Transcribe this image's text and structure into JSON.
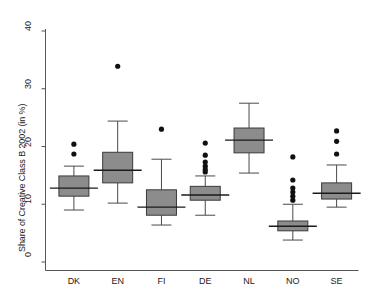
{
  "chart_data": {
    "type": "box",
    "title": "",
    "xlabel": "",
    "ylabel": "Share of Creative Class B 2002 (in %)",
    "ylim": [
      0,
      40
    ],
    "yticks": [
      0,
      10,
      20,
      30,
      40
    ],
    "ytick_labels": [
      "0",
      "10",
      "20",
      "30",
      "40"
    ],
    "grid": false,
    "legend": "none",
    "categories": [
      "DK",
      "EN",
      "FI",
      "DE",
      "NL",
      "NO",
      "SE"
    ],
    "boxes": [
      {
        "category": "DK",
        "whisker_low": 9.0,
        "q1": 11.4,
        "median": 12.8,
        "q3": 14.9,
        "whisker_high": 16.6,
        "outliers": [
          18.7,
          20.4
        ]
      },
      {
        "category": "EN",
        "whisker_low": 10.2,
        "q1": 13.7,
        "median": 15.9,
        "q3": 19.0,
        "whisker_high": 24.4,
        "outliers": [
          33.9
        ]
      },
      {
        "category": "FI",
        "whisker_low": 6.4,
        "q1": 8.1,
        "median": 9.5,
        "q3": 12.5,
        "whisker_high": 17.8,
        "outliers": [
          23.0
        ]
      },
      {
        "category": "DE",
        "whisker_low": 8.1,
        "q1": 10.7,
        "median": 11.6,
        "q3": 13.1,
        "whisker_high": 14.9,
        "outliers": [
          15.6,
          16.0,
          16.6,
          17.3,
          18.5,
          20.6
        ]
      },
      {
        "category": "NL",
        "whisker_low": 15.4,
        "q1": 18.9,
        "median": 21.1,
        "q3": 23.2,
        "whisker_high": 27.5,
        "outliers": []
      },
      {
        "category": "NO",
        "whisker_low": 3.8,
        "q1": 5.4,
        "median": 6.2,
        "q3": 7.1,
        "whisker_high": 10.0,
        "outliers": [
          10.7,
          11.4,
          12.1,
          12.8,
          14.2,
          18.2
        ]
      },
      {
        "category": "SE",
        "whisker_low": 9.5,
        "q1": 10.9,
        "median": 11.9,
        "q3": 13.7,
        "whisker_high": 16.8,
        "outliers": [
          18.7,
          20.9,
          22.7
        ]
      }
    ],
    "colors": {
      "box_fill": "#8c8c8c",
      "box_edge": "#3a3a3a",
      "whisker": "#4a4a4a",
      "median": "#1a1a1a",
      "outlier": "#111111",
      "axis": "#555555",
      "text": "#1a1a1a",
      "background": "#ffffff"
    }
  }
}
